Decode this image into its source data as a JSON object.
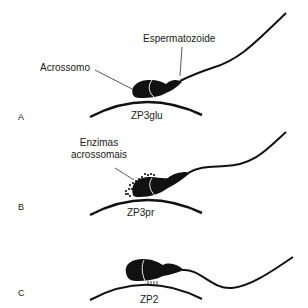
{
  "figure": {
    "panels": [
      {
        "letter": "A",
        "labels": {
          "sperm": "Espermatozoide",
          "acrosome": "Acrossomo",
          "zona": "ZP3glu"
        }
      },
      {
        "letter": "B",
        "labels": {
          "enzymes_line1": "Enzimas",
          "enzymes_line2": "acrossomais",
          "zona": "ZP3pr"
        }
      },
      {
        "letter": "C",
        "labels": {
          "zona": "ZP2"
        }
      }
    ],
    "colors": {
      "ink": "#111111",
      "background": "#ffffff",
      "highlight": "#e8e8e8"
    }
  }
}
